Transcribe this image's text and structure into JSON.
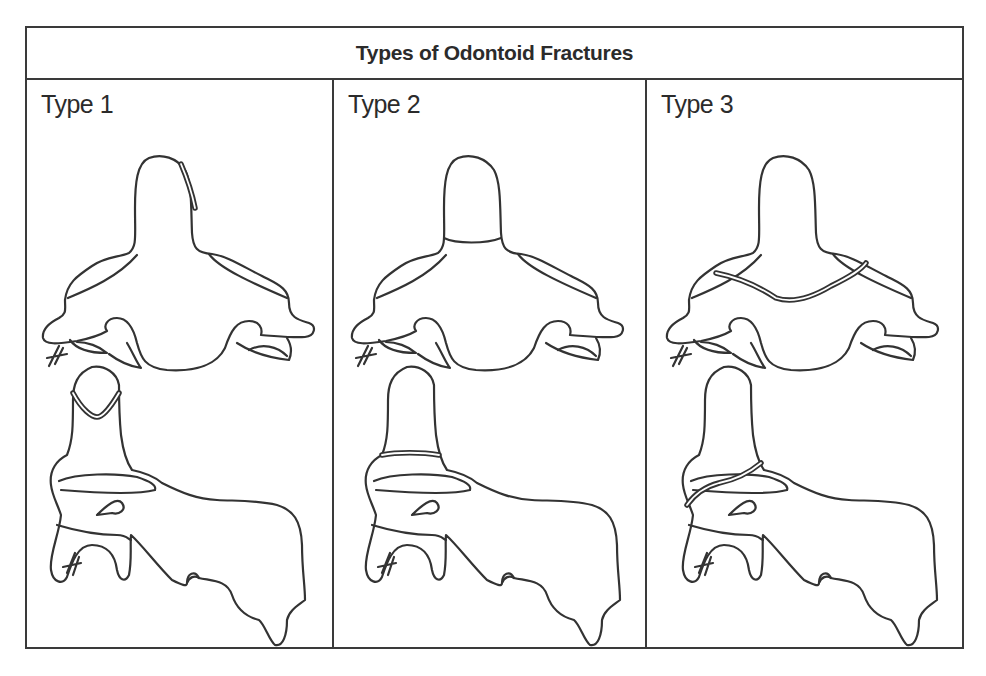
{
  "figure": {
    "title": "Types of Odontoid Fractures",
    "panels": [
      {
        "label": "Type 1",
        "fracture_location": "odontoid tip (avulsion)"
      },
      {
        "label": "Type 2",
        "fracture_location": "base of odontoid"
      },
      {
        "label": "Type 3",
        "fracture_location": "extends into body of C2"
      }
    ],
    "views": [
      "anterior",
      "lateral"
    ],
    "colors": {
      "line": "#333333",
      "background": "#ffffff",
      "border": "#3a3a3a"
    }
  }
}
